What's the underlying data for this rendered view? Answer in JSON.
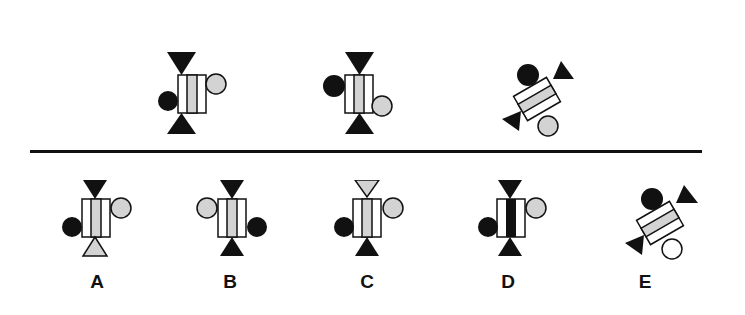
{
  "puzzle": {
    "type": "visual analogy / pattern reasoning",
    "colors": {
      "black": "#111111",
      "gray": "#d3d3d3",
      "white": "#ffffff",
      "stroke": "#111111"
    },
    "sequence": [
      {
        "id": "seq-1",
        "rotation": 0,
        "top_triangle": "black",
        "bottom_triangle": "black",
        "center_stripe": "gray",
        "right_circle": "gray-upper",
        "left_circle": "black-lower"
      },
      {
        "id": "seq-2",
        "rotation": 0,
        "top_triangle": "black",
        "bottom_triangle": "black",
        "center_stripe": "gray",
        "left_circle": "black-upper",
        "right_circle": "gray-lower"
      },
      {
        "id": "seq-3",
        "rotation": 60,
        "top_triangle": "black",
        "bottom_triangle": "black",
        "center_stripe": "gray",
        "circle_top": "black",
        "circle_bottom": "gray"
      }
    ],
    "options": [
      {
        "label": "A",
        "top_triangle": "black",
        "bottom_triangle": "gray",
        "center_stripe": "gray",
        "right_circle": "gray-upper",
        "left_circle": "black-lower"
      },
      {
        "label": "B",
        "top_triangle": "black",
        "bottom_triangle": "black",
        "center_stripe": "gray",
        "left_circle": "gray-upper",
        "right_circle": "black-lower"
      },
      {
        "label": "C",
        "top_triangle": "gray",
        "bottom_triangle": "black",
        "center_stripe": "gray",
        "right_circle": "gray-upper",
        "left_circle": "black-lower"
      },
      {
        "label": "D",
        "top_triangle": "black",
        "bottom_triangle": "black",
        "center_stripe": "black",
        "right_circle": "gray-upper",
        "left_circle": "black-lower"
      },
      {
        "label": "E",
        "rotation": 60,
        "top_triangle": "black",
        "bottom_triangle": "black",
        "center_stripe": "gray",
        "circle_top": "black",
        "circle_bottom": "white"
      }
    ]
  }
}
